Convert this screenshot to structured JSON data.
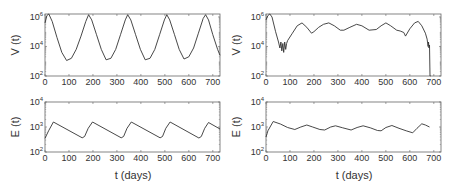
{
  "chart_data": [
    {
      "id": "left-top",
      "type": "line",
      "ylabel": "V (t)",
      "xlabel": "",
      "yscale": "log",
      "xlim": [
        0,
        730
      ],
      "ylim_log10": [
        2,
        6.2
      ],
      "xticks": [
        0,
        100,
        200,
        300,
        400,
        500,
        600,
        700
      ],
      "yticks": [
        {
          "exp": 2,
          "label": "10",
          "sup": "2"
        },
        {
          "exp": 4,
          "label": "10",
          "sup": "4"
        },
        {
          "exp": 6,
          "label": "10",
          "sup": "6"
        }
      ],
      "series": [
        {
          "name": "V",
          "x": [
            0,
            8,
            16,
            30,
            50,
            70,
            90,
            110,
            130,
            150,
            170,
            182,
            195,
            215,
            235,
            255,
            275,
            295,
            315,
            335,
            345,
            358,
            378,
            398,
            418,
            438,
            458,
            478,
            498,
            508,
            520,
            540,
            560,
            580,
            600,
            620,
            640,
            660,
            670,
            682,
            700,
            720,
            730
          ],
          "log10y": [
            5.6,
            6.1,
            6.2,
            5.7,
            4.6,
            3.6,
            3.05,
            3.2,
            3.8,
            4.7,
            5.7,
            6.15,
            5.8,
            4.8,
            3.8,
            3.1,
            3.2,
            3.8,
            4.8,
            5.8,
            6.15,
            5.8,
            4.8,
            3.8,
            3.1,
            3.2,
            3.8,
            4.8,
            5.8,
            6.15,
            5.8,
            4.8,
            3.8,
            3.15,
            3.3,
            3.9,
            4.9,
            5.9,
            6.15,
            5.8,
            4.8,
            3.8,
            3.4
          ]
        }
      ]
    },
    {
      "id": "right-top",
      "type": "line",
      "ylabel": "V (t)",
      "xlabel": "",
      "yscale": "log",
      "xlim": [
        0,
        730
      ],
      "ylim_log10": [
        2,
        6.2
      ],
      "xticks": [
        0,
        100,
        200,
        300,
        400,
        500,
        600,
        700
      ],
      "yticks": [
        {
          "exp": 2,
          "label": "10",
          "sup": "2"
        },
        {
          "exp": 4,
          "label": "10",
          "sup": "4"
        },
        {
          "exp": 6,
          "label": "10",
          "sup": "6"
        }
      ],
      "series": [
        {
          "name": "V",
          "x": [
            0,
            8,
            16,
            25,
            40,
            52,
            58,
            62,
            66,
            70,
            74,
            78,
            82,
            86,
            90,
            110,
            130,
            150,
            170,
            190,
            200,
            220,
            240,
            262,
            285,
            310,
            325,
            350,
            378,
            400,
            430,
            460,
            480,
            500,
            520,
            545,
            560,
            575,
            582,
            600,
            620,
            635,
            650,
            665,
            672,
            676,
            678,
            680,
            682,
            684,
            686
          ],
          "log10y": [
            5.8,
            6.1,
            6.2,
            6.0,
            5.0,
            4.3,
            3.9,
            4.3,
            3.7,
            4.2,
            3.6,
            4.3,
            3.8,
            4.2,
            4.4,
            4.9,
            5.4,
            5.6,
            5.3,
            4.9,
            5.0,
            5.3,
            5.5,
            5.6,
            5.4,
            5.1,
            5.1,
            5.3,
            5.5,
            5.4,
            5.1,
            5.15,
            5.4,
            5.6,
            5.4,
            5.1,
            5.05,
            4.95,
            4.7,
            5.2,
            5.6,
            5.7,
            5.4,
            4.9,
            4.5,
            4.0,
            4.3,
            3.9,
            4.1,
            2.0,
            2.0
          ]
        }
      ]
    },
    {
      "id": "left-bottom",
      "type": "line",
      "ylabel": "E (t)",
      "xlabel": "t (days)",
      "yscale": "log",
      "xlim": [
        0,
        730
      ],
      "ylim_log10": [
        2,
        4
      ],
      "xticks": [
        0,
        100,
        200,
        300,
        400,
        500,
        600,
        700
      ],
      "yticks": [
        {
          "exp": 2,
          "label": "10",
          "sup": "2"
        },
        {
          "exp": 3,
          "label": "10",
          "sup": "3"
        },
        {
          "exp": 4,
          "label": "10",
          "sup": "4"
        }
      ],
      "series": [
        {
          "name": "E",
          "x": [
            0,
            15,
            35,
            155,
            165,
            180,
            198,
            318,
            328,
            342,
            360,
            480,
            490,
            504,
            522,
            642,
            652,
            666,
            682,
            730
          ],
          "log10y": [
            2.55,
            2.85,
            3.2,
            2.57,
            2.62,
            2.95,
            3.2,
            2.57,
            2.62,
            2.95,
            3.2,
            2.57,
            2.62,
            2.95,
            3.2,
            2.56,
            2.62,
            2.95,
            3.18,
            2.92
          ]
        }
      ]
    },
    {
      "id": "right-bottom",
      "type": "line",
      "ylabel": "E (t)",
      "xlabel": "t (days)",
      "yscale": "log",
      "xlim": [
        0,
        730
      ],
      "ylim_log10": [
        2,
        4
      ],
      "xticks": [
        0,
        100,
        200,
        300,
        400,
        500,
        600,
        700
      ],
      "yticks": [
        {
          "exp": 2,
          "label": "10",
          "sup": "2"
        },
        {
          "exp": 3,
          "label": "10",
          "sup": "3"
        },
        {
          "exp": 4,
          "label": "10",
          "sup": "4"
        }
      ],
      "series": [
        {
          "name": "E",
          "x": [
            0,
            8,
            30,
            60,
            90,
            120,
            145,
            170,
            195,
            225,
            245,
            270,
            290,
            320,
            355,
            380,
            405,
            435,
            465,
            480,
            500,
            525,
            555,
            585,
            612,
            630,
            650,
            665,
            682
          ],
          "log10y": [
            2.6,
            2.85,
            3.22,
            3.12,
            2.98,
            2.9,
            3.0,
            3.08,
            3.0,
            2.9,
            2.88,
            3.0,
            3.05,
            2.97,
            2.88,
            2.98,
            3.05,
            2.97,
            2.86,
            2.85,
            2.98,
            3.06,
            2.95,
            2.85,
            2.77,
            2.95,
            3.13,
            3.08,
            3.0
          ]
        }
      ]
    }
  ],
  "labels": {
    "left_top_ylabel": "V (t)",
    "right_top_ylabel": "V (t)",
    "left_bottom_ylabel": "E (t)",
    "right_bottom_ylabel": "E (t)",
    "left_xlabel": "t (days)",
    "right_xlabel": "t (days)"
  },
  "colors": {
    "line": "#333333",
    "axis": "#666666",
    "text": "#333333"
  }
}
